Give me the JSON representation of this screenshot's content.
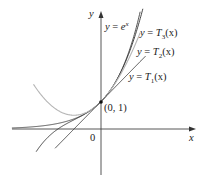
{
  "figure": {
    "type": "function-graph",
    "axes": {
      "x_label": "x",
      "y_label": "y",
      "origin_label": "0"
    },
    "point": {
      "label": "(0, 1)",
      "x": 0,
      "y": 1
    },
    "curves": [
      {
        "id": "exp",
        "label_lhs": "y = ",
        "label_rhs": "e",
        "label_sup": "x",
        "expression": "e^x",
        "color": "#444444"
      },
      {
        "id": "T3",
        "label_lhs": "y = T",
        "label_sub": "3",
        "label_arg": "(x)",
        "expression": "1 + x + x^2/2 + x^3/6",
        "color": "#333333"
      },
      {
        "id": "T2",
        "label_lhs": "y = T",
        "label_sub": "2",
        "label_arg": "(x)",
        "expression": "1 + x + x^2/2",
        "color": "#b5b5b5"
      },
      {
        "id": "T1",
        "label_lhs": "y = T",
        "label_sub": "1",
        "label_arg": "(x)",
        "expression": "1 + x",
        "color": "#333333"
      }
    ],
    "colors": {
      "axis": "#333333",
      "background": "#ffffff"
    }
  }
}
